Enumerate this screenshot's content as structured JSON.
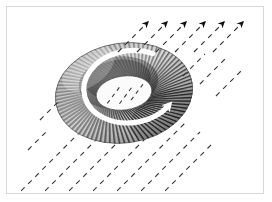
{
  "figure": {
    "title": "Toroidal coil in an external magnetic field",
    "caption": "",
    "background_color": "#ffffff",
    "frame": {
      "border_color": "#d8d8d8",
      "border_width_px": 1,
      "inset_px": 6,
      "width_px": 258,
      "height_px": 188
    }
  },
  "chart_data": {
    "type": "diagram",
    "title": "Toroidal coil in an external magnetic field",
    "xlabel": "",
    "ylabel": "",
    "legend": [],
    "annotations": [],
    "objects": [
      {
        "name": "toroid-coil",
        "label": "Toroidal wound coil",
        "shape": "torus",
        "center_x": 124,
        "center_y": 93,
        "outer_rx": 69,
        "outer_ry": 50,
        "inner_rx": 28,
        "inner_ry": 17,
        "rotation_deg": -8,
        "winding_turns": 86,
        "wire_color": "#1a1a1a",
        "highlight_color": "#f2f2f2"
      },
      {
        "name": "current-direction-arrow",
        "label": "Current direction (white circular arrow)",
        "shape": "circular-arrow",
        "color": "#ffffff",
        "center_x": 124,
        "center_y": 93,
        "rx": 47,
        "ry": 36,
        "stroke_width": 5,
        "direction": "counterclockwise-viewed-from-above"
      }
    ],
    "field": {
      "name": "external-magnetic-field",
      "label": "External magnetic field lines",
      "line_style": "dashed",
      "color": "#3a3a3a",
      "angle_deg": 45,
      "dash_pattern": "5 5",
      "line_count": 11,
      "arrow_count": 6,
      "arrow_color": "#111111",
      "arrow_tips": [
        {
          "x": 152,
          "y": 16
        },
        {
          "x": 171,
          "y": 16
        },
        {
          "x": 190,
          "y": 16
        },
        {
          "x": 209,
          "y": 16
        },
        {
          "x": 228,
          "y": 16
        },
        {
          "x": 247,
          "y": 16
        }
      ],
      "line_starts": [
        {
          "x": 18,
          "y": 196
        },
        {
          "x": 42,
          "y": 196
        },
        {
          "x": 66,
          "y": 196
        },
        {
          "x": 90,
          "y": 196
        },
        {
          "x": 114,
          "y": 196
        },
        {
          "x": 138,
          "y": 196
        },
        {
          "x": 60,
          "y": 136
        },
        {
          "x": 84,
          "y": 136
        },
        {
          "x": 108,
          "y": 136
        },
        {
          "x": 132,
          "y": 136
        },
        {
          "x": 156,
          "y": 136
        }
      ]
    },
    "colors": {
      "background": "#ffffff",
      "frame_border": "#d8d8d8",
      "wire_dark": "#1a1a1a",
      "wire_mid": "#6b6b6b",
      "wire_light": "#e8e8e8",
      "field_line": "#3a3a3a",
      "current_arrow": "#ffffff"
    }
  }
}
